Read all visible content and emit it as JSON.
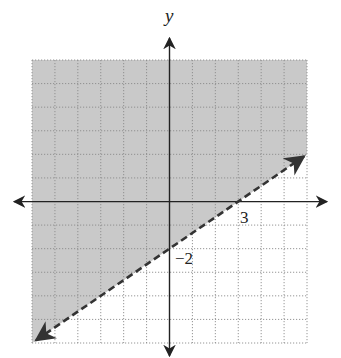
{
  "chart_data": {
    "type": "line",
    "title": "",
    "xlabel": "",
    "ylabel": "y",
    "xlim": [
      -6,
      6
    ],
    "ylim": [
      -6,
      6
    ],
    "grid": true,
    "grid_style": "dotted",
    "boundary": {
      "style": "dashed",
      "equation": "y = (2/3)x - 2",
      "slope": 0.6667,
      "intercept": -2,
      "points": [
        {
          "x": -6,
          "y": -6
        },
        {
          "x": 0,
          "y": -2
        },
        {
          "x": 3,
          "y": 0
        },
        {
          "x": 6,
          "y": 2
        }
      ]
    },
    "shaded_region": "above boundary line",
    "annotations": [
      {
        "text": "3",
        "x": 3,
        "y": 0,
        "meaning": "x-intercept"
      },
      {
        "text": "−2",
        "x": 0,
        "y": -2,
        "meaning": "y-intercept"
      }
    ]
  },
  "labels": {
    "y_axis": "y",
    "x_intercept": "3",
    "y_intercept": "−2"
  },
  "colors": {
    "shade": "#c9c9c9",
    "grid": "#8a8a8a",
    "axis": "#222222",
    "boundary": "#333333"
  }
}
